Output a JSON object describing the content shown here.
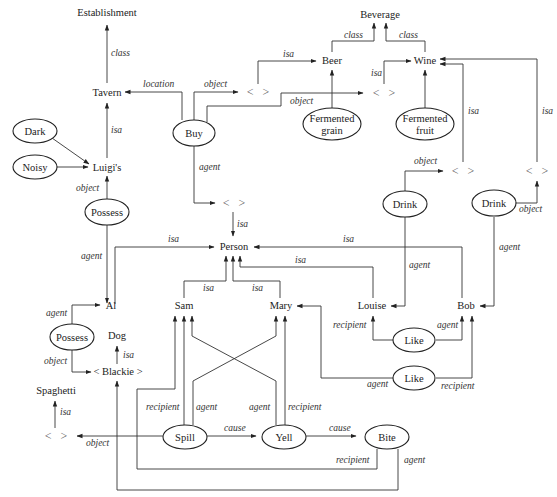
{
  "figure": {
    "header_fragment": "FIGURE 9.2"
  },
  "nodes": {
    "establishment": "Establishment",
    "tavern": "Tavern",
    "luigis": "Luigi's",
    "dark": "Dark",
    "noisy": "Noisy",
    "possess1": "Possess",
    "al": "Al",
    "possess2": "Possess",
    "dog": "Dog",
    "blackie": "< Blackie >",
    "spaghetti": "Spaghetti",
    "anon_spaghetti": "<   >",
    "buy": "Buy",
    "anon_buy_object": "<   >",
    "anon_buy_object2": "<   >",
    "anon_buy_agent": "<   >",
    "beverage": "Beverage",
    "beer": "Beer",
    "wine": "Wine",
    "fermented_grain_1": "Fermented",
    "fermented_grain_2": "grain",
    "fermented_fruit_1": "Fermented",
    "fermented_fruit_2": "fruit",
    "anon_drink1": "<   >",
    "anon_drink2": "<   >",
    "drink1": "Drink",
    "drink2": "Drink",
    "person": "Person",
    "sam": "Sam",
    "mary": "Mary",
    "louise": "Louise",
    "bob": "Bob",
    "like1": "Like",
    "like2": "Like",
    "spill": "Spill",
    "yell": "Yell",
    "bite": "Bite"
  },
  "edges": {
    "class": "class",
    "isa": "isa",
    "location": "location",
    "object": "object",
    "agent": "agent",
    "recipient": "recipient",
    "cause": "cause"
  }
}
